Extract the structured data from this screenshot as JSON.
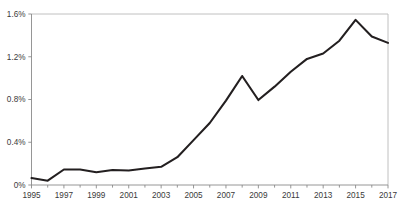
{
  "chart_data": {
    "type": "line",
    "title": "",
    "subtitle": "",
    "xlabel": "",
    "ylabel": "",
    "x": [
      1995,
      1996,
      1997,
      1998,
      1999,
      2000,
      2001,
      2002,
      2003,
      2004,
      2005,
      2006,
      2007,
      2008,
      2009,
      2010,
      2011,
      2012,
      2013,
      2014,
      2015,
      2016,
      2017
    ],
    "values": [
      0.065,
      0.04,
      0.145,
      0.145,
      0.12,
      0.14,
      0.135,
      0.155,
      0.17,
      0.26,
      0.42,
      0.58,
      0.79,
      1.02,
      0.795,
      0.92,
      1.06,
      1.18,
      1.23,
      1.35,
      1.545,
      1.39,
      1.33
    ],
    "series": [
      {
        "name": "series-1",
        "values": [
          0.065,
          0.04,
          0.145,
          0.145,
          0.12,
          0.14,
          0.135,
          0.155,
          0.17,
          0.26,
          0.42,
          0.58,
          0.79,
          1.02,
          0.795,
          0.92,
          1.06,
          1.18,
          1.23,
          1.35,
          1.545,
          1.39,
          1.33
        ],
        "color": "#231f20"
      }
    ],
    "xlim": [
      1995,
      2017
    ],
    "ylim": [
      0,
      1.6
    ],
    "yticks": [
      0,
      0.4,
      0.8,
      1.2,
      1.6
    ],
    "ytick_labels": [
      "0%",
      "0.4%",
      "0.8%",
      "1.2%",
      "1.6%"
    ],
    "xticks": [
      1995,
      1997,
      1999,
      2001,
      2003,
      2005,
      2007,
      2009,
      2011,
      2013,
      2015,
      2017
    ],
    "xtick_labels": [
      "1995",
      "1997",
      "1999",
      "2001",
      "2003",
      "2005",
      "2007",
      "2009",
      "2011",
      "2013",
      "2015",
      "2017"
    ],
    "xtick_minor": [
      1996,
      1998,
      2000,
      2002,
      2004,
      2006,
      2008,
      2010,
      2012,
      2014,
      2016
    ],
    "grid": false,
    "legend": null,
    "legend_position": "none",
    "annotations": [],
    "colors": {
      "line": "#231f20",
      "axis": "#8a8a8a",
      "frame": "#b9b9b9",
      "text": "#3a3a3a",
      "background": "#ffffff"
    }
  }
}
